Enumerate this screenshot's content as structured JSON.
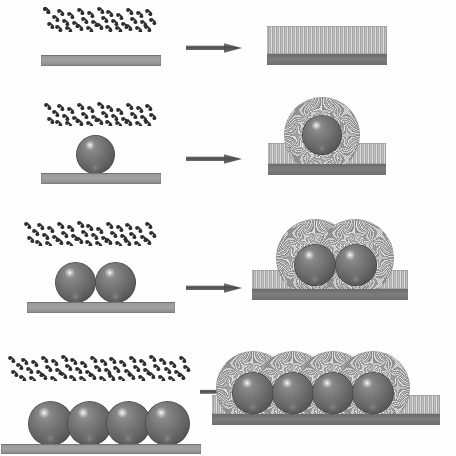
{
  "figure": {
    "type": "process-diagram",
    "background_color": "#ffffff",
    "width": 456,
    "height": 456,
    "row_count": 4,
    "colors": {
      "substrate_gray": "#9a9a9a",
      "substrate_edge_dark": "#6e6e6e",
      "film_gray": "#b5b5b5",
      "film_base_dark": "#6f6f6f",
      "sphere_dark": "#545454",
      "sphere_highlight": "#ffffff",
      "halo_gray": "#a9a9a9",
      "arrow_gray": "#5a5a5a",
      "molecule_dark": "#2f2f2f"
    },
    "legend_note": "Left column: reactant molecules above substrate. Right column: grown product after reaction."
  },
  "rows": [
    {
      "id": "row-1",
      "label": "flat substrate, no spheres",
      "sphere_count": 0,
      "reactant": {
        "name": "molecule-cloud",
        "description": "dispersed precursor molecules",
        "substrate": "flat bare substrate bar"
      },
      "product": {
        "name": "nanowire-film",
        "description": "uniform vertically aligned nanowire film on substrate",
        "halo_count": 0
      },
      "arrow": {
        "name": "reaction-arrow",
        "direction": "right"
      }
    },
    {
      "id": "row-2",
      "label": "substrate with one sphere",
      "sphere_count": 1,
      "reactant": {
        "name": "molecule-cloud",
        "description": "dispersed precursor molecules",
        "substrate": "flat substrate bar with single sphere"
      },
      "product": {
        "name": "nanowire-film-with-halo",
        "description": "nanowire film on substrate plus radial nanowire halo around sphere",
        "halo_count": 1
      },
      "arrow": {
        "name": "reaction-arrow",
        "direction": "right"
      }
    },
    {
      "id": "row-3",
      "label": "substrate with two spheres",
      "sphere_count": 2,
      "reactant": {
        "name": "molecule-cloud",
        "description": "dispersed precursor molecules",
        "substrate": "flat substrate bar with two contacting spheres"
      },
      "product": {
        "name": "nanowire-film-with-halos",
        "description": "nanowire film on substrate plus two overlapping radial halos",
        "halo_count": 2
      },
      "arrow": {
        "name": "reaction-arrow",
        "direction": "right"
      }
    },
    {
      "id": "row-4",
      "label": "substrate with four spheres",
      "sphere_count": 4,
      "reactant": {
        "name": "molecule-cloud",
        "description": "dispersed precursor molecules",
        "substrate": "flat substrate bar with four contacting spheres"
      },
      "product": {
        "name": "nanowire-film-with-halos",
        "description": "nanowire film on substrate plus four overlapping radial halos",
        "halo_count": 4
      },
      "arrow": {
        "name": "reaction-arrow",
        "direction": "right"
      }
    }
  ]
}
